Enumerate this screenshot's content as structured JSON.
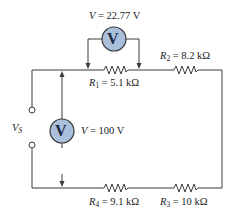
{
  "diagram": {
    "type": "series circuit with voltmeters",
    "source": {
      "label": "V",
      "subscript": "S"
    },
    "voltmeter_source": {
      "symbol": "V",
      "reading_prefix": "V",
      "reading_value": " = 100 V"
    },
    "voltmeter_r1": {
      "symbol": "V",
      "reading_prefix": "V",
      "reading_value": " = 22.77 V"
    },
    "resistors": [
      {
        "name": "R",
        "sub": "1",
        "value": " = 5.1 kΩ"
      },
      {
        "name": "R",
        "sub": "2",
        "value": " = 8.2 kΩ"
      },
      {
        "name": "R",
        "sub": "3",
        "value": " = 10 kΩ"
      },
      {
        "name": "R",
        "sub": "4",
        "value": " = 9.1 kΩ"
      }
    ],
    "colors": {
      "meter_fill": "#a9bfdc",
      "meter_stroke": "#3a3a3a",
      "wire": "#3a3a3a"
    }
  }
}
